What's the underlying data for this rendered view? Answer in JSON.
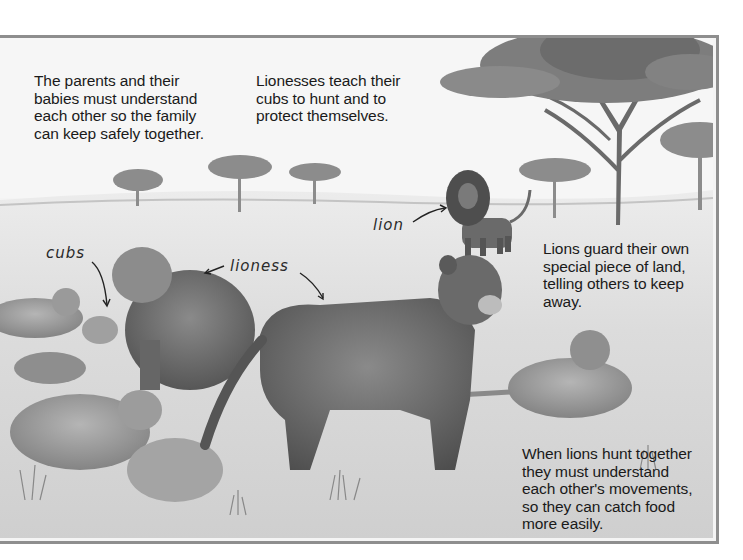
{
  "captions": {
    "family": "The parents and their\nbabies must understand\neach other so the family\ncan keep safely together.",
    "teach": "Lionesses teach their\ncubs to hunt and to\nprotect themselves.",
    "territory": "Lions guard their own\nspecial piece of land,\ntelling others to keep\naway.",
    "hunt": "When lions hunt together\nthey must understand\neach other's movements,\nso they can catch food\nmore easily."
  },
  "labels": {
    "cubs": "cubs",
    "lioness": "lioness",
    "lion": "lion"
  },
  "illustration": {
    "subject": "savanna scene with lion pride",
    "elements": [
      "acacia-trees",
      "male-lion",
      "lionesses",
      "cubs",
      "grassland"
    ],
    "colors": {
      "frame_border": "#8e8e8e",
      "sky": "#f4f4f4",
      "ground": "#d8d8d8",
      "animal_dark": "#5a5a5a",
      "animal_mid": "#7a7a7a",
      "tree": "#6e6e6e"
    }
  }
}
